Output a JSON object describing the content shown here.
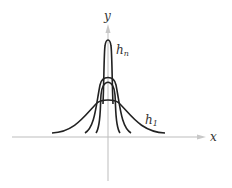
{
  "diagram": {
    "axes": {
      "x_label": "x",
      "y_label": "y",
      "axis_color": "#b8b8b8"
    },
    "curves": [
      {
        "name": "h_1",
        "label_main": "h",
        "label_sub": "1",
        "peak": 99,
        "half_width": 57
      },
      {
        "name": "h_middle",
        "label_main": "",
        "label_sub": "",
        "peak": 75,
        "half_width": 23
      },
      {
        "name": "h_n",
        "label_main": "h",
        "label_sub": "n",
        "peak": 40,
        "half_width": 12
      }
    ],
    "curve_color": "#222222"
  }
}
